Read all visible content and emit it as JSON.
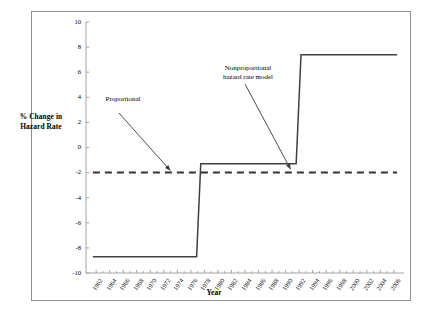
{
  "chart_data": {
    "type": "line",
    "title": "",
    "xlabel": "Year",
    "ylabel": "% Change in\nHazard Rate",
    "xlim": [
      1961,
      2007
    ],
    "ylim": [
      -10,
      10
    ],
    "grid": false,
    "legend_position": "none",
    "x_tick_labels": [
      "1962",
      "1964",
      "1966",
      "1968",
      "1970",
      "1972",
      "1974",
      "1976",
      "1978",
      "1980",
      "1982",
      "1984",
      "1986",
      "1988",
      "1990",
      "1992",
      "1994",
      "1996",
      "1998",
      "2000",
      "2002",
      "2004",
      "2006"
    ],
    "y_tick_labels": [
      "10",
      "8",
      "6",
      "4",
      "2",
      "0",
      "-2",
      "-4",
      "-6",
      "-8",
      "-10"
    ],
    "y_ticks": [
      10,
      8,
      6,
      4,
      2,
      0,
      -2,
      -4,
      -6,
      -8,
      -10
    ],
    "series": [
      {
        "name": "Nonproportional hazard rate model",
        "style": "solid",
        "color": "#404040",
        "shape": "step",
        "points": [
          {
            "x": 1962,
            "y": -8.7
          },
          {
            "x": 1977,
            "y": -8.7
          },
          {
            "x": 1977.6,
            "y": -1.3
          },
          {
            "x": 1991.4,
            "y": -1.3
          },
          {
            "x": 1992.1,
            "y": 7.4
          },
          {
            "x": 2006,
            "y": 7.4
          }
        ]
      },
      {
        "name": "Proportional",
        "style": "dashed",
        "color": "#333333",
        "shape": "constant",
        "points": [
          {
            "x": 1962,
            "y": -2.0
          },
          {
            "x": 2006,
            "y": -2.0
          }
        ]
      }
    ],
    "annotations": [
      {
        "name": "proportional-label",
        "text": "Proportional",
        "target_x": 1973.2,
        "target_y": -2.0
      },
      {
        "name": "nonproportional-label",
        "text": "Nonproportional\nhazard rate model",
        "target_x": 1990.6,
        "target_y": -1.9
      }
    ]
  }
}
